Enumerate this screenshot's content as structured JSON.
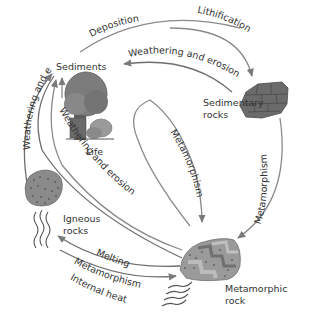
{
  "diagram": {
    "type": "rock-cycle",
    "nodes": {
      "sediments": {
        "label": "Sediments"
      },
      "life": {
        "label": "Life"
      },
      "sedimentary": {
        "line1": "Sedimentary",
        "line2": "rocks"
      },
      "igneous": {
        "line1": "Igneous",
        "line2": "rocks"
      },
      "metamorphic": {
        "line1": "Metamorphic",
        "line2": "rock"
      }
    },
    "edges": {
      "deposition": {
        "label": "Deposition",
        "from": "Sediments",
        "to": "Sedimentary rocks"
      },
      "lithification": {
        "label": "Lithification",
        "from": "Sediments",
        "to": "Sedimentary rocks"
      },
      "weathering_sed": {
        "label": "Weathering and erosion",
        "from": "Sedimentary rocks",
        "to": "Sediments"
      },
      "metamorphism_right": {
        "label": "Metamorphism",
        "from": "Sedimentary rocks",
        "to": "Metamorphic rock"
      },
      "metamorphism_inner": {
        "label": "Metamorphism",
        "from": "Sediments",
        "to": "Metamorphic rock"
      },
      "weathering_left": {
        "label": "Weathering and erosion",
        "from": "Igneous rocks",
        "to": "Sediments"
      },
      "weathering_meta": {
        "label": "Weathering and erosion",
        "from": "Metamorphic rock",
        "to": "Sediments"
      },
      "melting": {
        "label": "Melting",
        "from": "Metamorphic rock",
        "to": "Igneous rocks"
      },
      "metamorphism_bottom": {
        "label": "Metamorphism",
        "from": "Igneous rocks",
        "to": "Metamorphic rock"
      },
      "internal_heat": {
        "label": "Internal heat"
      }
    },
    "colors": {
      "arrow": "#8a8a8a",
      "text": "#333333",
      "rock_dark": "#6b6b6b",
      "rock_mid": "#8c8c8c",
      "rock_light": "#b5b5b5",
      "tree": "#7a7a7a"
    }
  }
}
